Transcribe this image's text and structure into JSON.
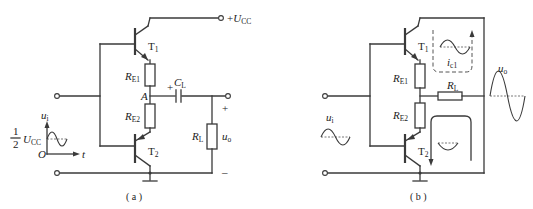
{
  "figure": {
    "panel_a": {
      "caption": "( a )",
      "supply": {
        "prefix": "+",
        "symbol": "U",
        "subscript": "CC"
      },
      "transistors": [
        {
          "symbol": "T",
          "subscript": "1"
        },
        {
          "symbol": "T",
          "subscript": "2"
        }
      ],
      "resistors": [
        {
          "symbol": "R",
          "subscript": "E1"
        },
        {
          "symbol": "R",
          "subscript": "E2"
        },
        {
          "symbol": "R",
          "subscript": "L"
        }
      ],
      "capacitor": {
        "symbol": "C",
        "subscript": "L",
        "polarity": "+"
      },
      "node_label": "A",
      "output": {
        "symbol": "u",
        "subscript": "o",
        "plus": "+",
        "minus": "–"
      },
      "input_graph": {
        "y_axis": {
          "symbol": "u",
          "subscript": "i"
        },
        "x_axis": "t",
        "origin": "O",
        "bias_fraction_num": "1",
        "bias_fraction_den": "2",
        "bias_symbol": "U",
        "bias_subscript": "CC"
      }
    },
    "panel_b": {
      "caption": "( b )",
      "transistors": [
        {
          "symbol": "T",
          "subscript": "1"
        },
        {
          "symbol": "T",
          "subscript": "2"
        }
      ],
      "resistors": [
        {
          "symbol": "R",
          "subscript": "E1"
        },
        {
          "symbol": "R",
          "subscript": "E2"
        },
        {
          "symbol": "R",
          "subscript": "L"
        }
      ],
      "current_label": {
        "symbol": "i",
        "subscript": "c1"
      },
      "input_wave": {
        "symbol": "u",
        "subscript": "i"
      },
      "output_wave": {
        "symbol": "u",
        "subscript": "o"
      }
    }
  }
}
